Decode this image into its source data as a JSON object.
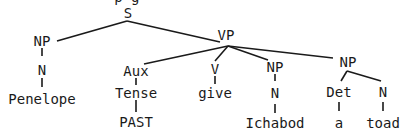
{
  "diagram": {
    "type": "syntax-tree",
    "top_fragment": "· · · p g ·",
    "nodes": {
      "S": "S",
      "NP1": "NP",
      "N1": "N",
      "Penelope": "Penelope",
      "VP": "VP",
      "Aux": "Aux",
      "Tense": "Tense",
      "PAST": "PAST",
      "V": "V",
      "give": "give",
      "NP2": "NP",
      "N2": "N",
      "Ichabod": "Ichabod",
      "NP3": "NP",
      "Det": "Det",
      "a": "a",
      "N3": "N",
      "toad": "toad"
    }
  }
}
